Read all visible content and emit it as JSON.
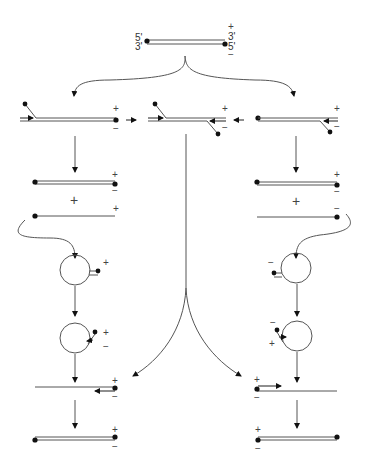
{
  "diagram": {
    "type": "replication-pathway",
    "top_duplex": {
      "left_labels": [
        "5'",
        "3'"
      ],
      "right_labels": [
        "+",
        "3'",
        "5'",
        "−"
      ]
    },
    "signs": {
      "plus": "+",
      "minus": "−"
    },
    "row_intermediates": {
      "left": {
        "top": "+",
        "bottom": "−"
      },
      "middle": {
        "top": "+",
        "bottom": "−"
      },
      "right": {
        "top": "+",
        "bottom": "−"
      }
    },
    "left_branch": {
      "duplex": {
        "top": "+",
        "bottom": "−"
      },
      "plus_between": "+",
      "single_strand": "+",
      "circle1": "+",
      "circle2": {
        "top": "+",
        "bottom": "−"
      },
      "linear": {
        "top": "+",
        "bottom": "−"
      },
      "final": {
        "top": "+",
        "bottom": "−"
      }
    },
    "right_branch": {
      "duplex": {
        "top": "+",
        "bottom": "−"
      },
      "plus_between": "+",
      "single_strand": "−",
      "circle1": "−",
      "circle2": {
        "top": "−",
        "bottom": "+"
      },
      "linear": {
        "top": "+",
        "bottom": "−"
      },
      "final": {
        "top": "+",
        "bottom": "−"
      }
    }
  }
}
